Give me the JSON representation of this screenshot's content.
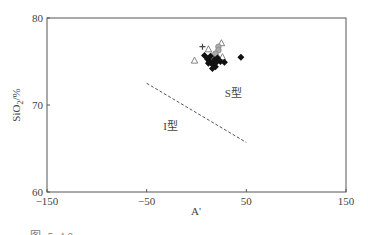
{
  "chart_data": {
    "type": "scatter",
    "title": "",
    "xlabel": "A'",
    "ylabel": "SiO2/%",
    "xlim": [
      -150,
      150
    ],
    "ylim": [
      60,
      80
    ],
    "x_ticks": [
      -150,
      -50,
      50,
      150
    ],
    "x_tick_labels": [
      "−150",
      "−50",
      "50",
      "150"
    ],
    "y_ticks": [
      60,
      70,
      80
    ],
    "y_tick_labels": [
      "60",
      "70",
      "80"
    ],
    "grid": false,
    "legend": null,
    "divider_line": {
      "style": "dashed",
      "points": [
        [
          -50,
          72.5
        ],
        [
          50,
          65.7
        ]
      ]
    },
    "annotations": [
      {
        "text": "S型",
        "x": 37,
        "y": 70.9
      },
      {
        "text": "I型",
        "x": -26,
        "y": 67.1
      }
    ],
    "series": [
      {
        "name": "open-triangle",
        "marker": "triangle-open",
        "points": [
          [
            -2,
            75.1
          ],
          [
            12,
            76.4
          ],
          [
            25,
            77.1
          ],
          [
            26,
            75.5
          ],
          [
            20,
            75.8
          ],
          [
            15,
            75.6
          ]
        ]
      },
      {
        "name": "plus",
        "marker": "plus",
        "points": [
          [
            6,
            76.7
          ]
        ]
      },
      {
        "name": "gray-circle",
        "marker": "circle-gray",
        "points": [
          [
            22,
            76.7
          ],
          [
            22,
            76.3
          ],
          [
            19,
            75.9
          ]
        ]
      },
      {
        "name": "filled-diamond",
        "marker": "diamond-filled",
        "points": [
          [
            8,
            75.7
          ],
          [
            11,
            75.3
          ],
          [
            13,
            75.0
          ],
          [
            15,
            74.8
          ],
          [
            17,
            74.6
          ],
          [
            19,
            74.4
          ],
          [
            14,
            75.6
          ],
          [
            18,
            75.2
          ],
          [
            21,
            75.4
          ],
          [
            24,
            75.0
          ],
          [
            28,
            74.9
          ],
          [
            16,
            74.2
          ],
          [
            12,
            74.8
          ],
          [
            20,
            74.9
          ],
          [
            44.5,
            75.5
          ]
        ]
      }
    ]
  },
  "caption": "图 5.10  ……"
}
